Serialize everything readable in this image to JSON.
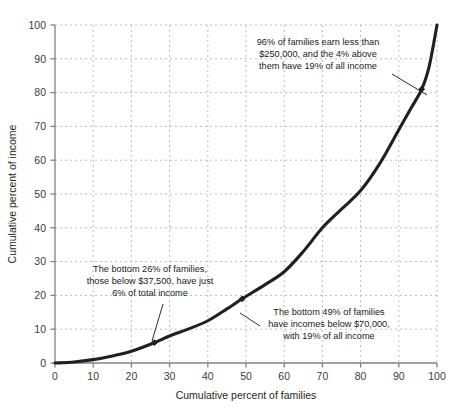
{
  "chart_data": {
    "type": "line",
    "title": "",
    "subtitle": "",
    "xlabel": "Cumulative percent of families",
    "ylabel": "Cumulative percent of income",
    "xlim": [
      0,
      100
    ],
    "ylim": [
      0,
      100
    ],
    "grid": true,
    "legend": "none",
    "xticks": [
      0,
      10,
      20,
      30,
      40,
      50,
      60,
      70,
      80,
      90,
      100
    ],
    "yticks": [
      0,
      10,
      20,
      30,
      40,
      50,
      60,
      70,
      80,
      90,
      100
    ],
    "series": [
      {
        "name": "Lorenz curve of family income",
        "x": [
          0,
          5,
          10,
          15,
          20,
          26,
          30,
          35,
          40,
          45,
          49,
          55,
          60,
          65,
          70,
          75,
          80,
          85,
          90,
          93,
          96,
          98,
          100
        ],
        "y": [
          0,
          0.3,
          1.0,
          2.1,
          3.5,
          6.0,
          8.0,
          10.1,
          12.5,
          16.0,
          19.0,
          23.2,
          27.0,
          33.0,
          40.0,
          45.5,
          51.0,
          59.0,
          69.0,
          75.0,
          81.0,
          88.0,
          100
        ]
      }
    ],
    "markers": [
      {
        "name": "marker-26-6",
        "x": 26,
        "y": 6
      },
      {
        "name": "marker-49-19",
        "x": 49,
        "y": 19
      },
      {
        "name": "marker-96-81",
        "x": 96,
        "y": 81
      }
    ],
    "annotations": [
      {
        "id": "annotation-top",
        "lines": [
          "96% of families earn less than",
          "$250,000, and the 4% above",
          "them have 19% of all income"
        ],
        "text_anchor_x": 318,
        "text_anchor_y": 45,
        "leader_from": [
          392,
          74
        ],
        "leader_to": [
          427,
          95
        ]
      },
      {
        "id": "annotation-left",
        "lines": [
          "The bottom 26% of families,",
          "those below $37,500, have just",
          "6% of total income"
        ],
        "text_anchor_x": 150,
        "text_anchor_y": 272,
        "leader_from": [
          163,
          304
        ],
        "leader_to": [
          152,
          341
        ]
      },
      {
        "id": "annotation-right",
        "lines": [
          "The bottom 49% of families",
          "have incomes below $70,000,",
          "with 19% of all income"
        ],
        "text_anchor_x": 329,
        "text_anchor_y": 315,
        "leader_from": [
          260,
          326
        ],
        "leader_to": [
          240,
          313
        ]
      }
    ],
    "colors": {
      "curve": "#231f20",
      "grid": "#bdbdbd",
      "axis": "#808080",
      "text": "#231f20",
      "background": "#ffffff"
    }
  }
}
